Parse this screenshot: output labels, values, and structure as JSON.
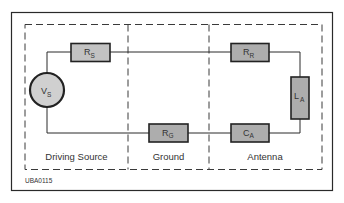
{
  "figure": {
    "code": "UBA0115",
    "sections": [
      {
        "id": "driving-source",
        "label": "Driving Source"
      },
      {
        "id": "ground",
        "label": "Ground"
      },
      {
        "id": "antenna",
        "label": "Antenna"
      }
    ],
    "components": {
      "vs": {
        "main": "V",
        "sub": "S",
        "type": "voltage-source"
      },
      "rs": {
        "main": "R",
        "sub": "S",
        "type": "resistor"
      },
      "rr": {
        "main": "R",
        "sub": "R",
        "type": "resistor"
      },
      "la": {
        "main": "L",
        "sub": "A",
        "type": "inductor"
      },
      "ca": {
        "main": "C",
        "sub": "A",
        "type": "capacitor"
      },
      "rg": {
        "main": "R",
        "sub": "G",
        "type": "resistor"
      }
    },
    "colors": {
      "component_fill": "#b0b0b0",
      "source_fill": "#d0d0d0",
      "line": "#2a2a2a",
      "text": "#333333"
    }
  }
}
